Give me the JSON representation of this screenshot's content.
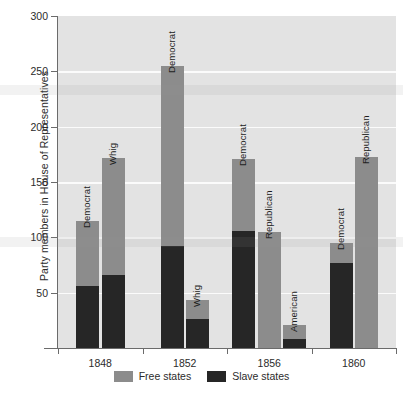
{
  "chart_data": {
    "type": "bar",
    "subtype": "stacked-grouped",
    "title": "",
    "xlabel": "",
    "ylabel": "Party members in House of Representatives",
    "ylim": [
      0,
      300
    ],
    "yticks": [
      50,
      100,
      150,
      200,
      250,
      300
    ],
    "grid": true,
    "legend_position": "bottom",
    "categories": [
      "1848",
      "1852",
      "1856",
      "1860"
    ],
    "series": [
      {
        "name": "Free states",
        "color": "#8c8c8c"
      },
      {
        "name": "Slave states",
        "color": "#262626"
      }
    ],
    "groups": [
      {
        "category": "1848",
        "bars": [
          {
            "party": "Democrat",
            "free": 59,
            "slave": 56,
            "total": 115
          },
          {
            "party": "Whig",
            "free": 106,
            "slave": 66,
            "total": 172
          }
        ]
      },
      {
        "category": "1852",
        "bars": [
          {
            "party": "Democrat",
            "free": 163,
            "slave": 92,
            "total": 255
          },
          {
            "party": "Whig",
            "free": 17,
            "slave": 26,
            "total": 43
          }
        ]
      },
      {
        "category": "1856",
        "bars": [
          {
            "party": "Democrat",
            "free": 65,
            "slave": 106,
            "total": 171
          },
          {
            "party": "Republican",
            "free": 105,
            "slave": 0,
            "total": 105
          },
          {
            "party": "American",
            "free": 13,
            "slave": 8,
            "total": 21
          }
        ]
      },
      {
        "category": "1860",
        "bars": [
          {
            "party": "Democrat",
            "free": 18,
            "slave": 77,
            "total": 95
          },
          {
            "party": "Republican",
            "free": 173,
            "slave": 0,
            "total": 173
          }
        ]
      }
    ]
  },
  "axes": {
    "y_title": "Party members in House of Representatives",
    "y_tick_labels": [
      "300",
      "250",
      "200",
      "150",
      "100",
      "50"
    ],
    "x_tick_labels": [
      "1848",
      "1852",
      "1856",
      "1860"
    ]
  },
  "legend": {
    "items": [
      {
        "label": "Free states",
        "color": "#8c8c8c"
      },
      {
        "label": "Slave states",
        "color": "#262626"
      }
    ]
  },
  "bar_labels": [
    "Democrat",
    "Whig",
    "Democrat",
    "Whig",
    "Democrat",
    "Republican",
    "American",
    "Democrat",
    "Republican"
  ],
  "colors": {
    "plot_background": "#e3e3e3",
    "gridline": "#fbfbfb",
    "free_states": "#8c8c8c",
    "slave_states": "#262626",
    "axis": "#6b6b6b",
    "text": "#2b2b2b"
  }
}
